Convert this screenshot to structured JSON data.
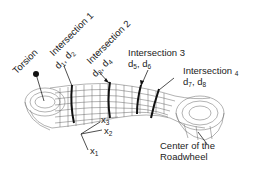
{
  "diagram": {
    "type": "wireframe-mesh-illustration",
    "labels": {
      "torsion": "Torsion",
      "intersection1": {
        "title": "Intersection 1",
        "vars": [
          "d",
          "1",
          ", d",
          "2"
        ]
      },
      "intersection2": {
        "title": "Intersection 2",
        "vars": [
          "d",
          "3",
          ", d",
          "4"
        ]
      },
      "intersection3": {
        "title": "Intersection 3",
        "vars": [
          "d",
          "5",
          ", d",
          "6"
        ]
      },
      "intersection4": {
        "title": "Intersection",
        "title_sub": "4",
        "vars": [
          "d",
          "7",
          ", d",
          "8"
        ]
      },
      "center": {
        "line1": "Center of the",
        "line2": "Roadwheel"
      }
    },
    "axes": {
      "x1": {
        "base": "x",
        "sub": "1"
      },
      "x2": {
        "base": "x",
        "sub": "2"
      },
      "x3": {
        "base": "x",
        "sub": "3"
      }
    },
    "colors": {
      "mesh": "#555555",
      "section": "#111111",
      "text": "#222222"
    }
  }
}
